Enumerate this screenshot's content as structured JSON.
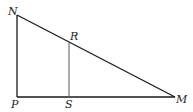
{
  "figure": {
    "type": "right-triangle-with-segment",
    "stroke_color": "#1a1a1a",
    "segment_color": "#555555",
    "points": {
      "N": {
        "x": 17,
        "y": 15
      },
      "P": {
        "x": 17,
        "y": 97
      },
      "M": {
        "x": 175,
        "y": 97
      },
      "R": {
        "x": 69,
        "y": 43
      },
      "S": {
        "x": 69,
        "y": 97
      }
    },
    "labels": {
      "N": "N",
      "P": "P",
      "M": "M",
      "R": "R",
      "S": "S"
    },
    "segments": [
      {
        "from": "N",
        "to": "P"
      },
      {
        "from": "P",
        "to": "M"
      },
      {
        "from": "N",
        "to": "M"
      },
      {
        "from": "R",
        "to": "S"
      }
    ]
  }
}
